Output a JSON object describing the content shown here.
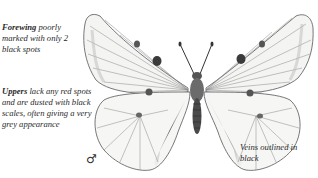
{
  "illustration": {
    "subject": "butterfly",
    "view": "upperside, male"
  },
  "annotations": {
    "forewing": {
      "bold": "Forewing",
      "text": " poorly marked with only 2 black spots"
    },
    "uppers": {
      "bold": "Uppers",
      "text": " lack any red spots and are dusted with black scales, often giving a very grey appearance"
    },
    "veins": {
      "text": "Veins outlined in black"
    },
    "sex_symbol": "♂"
  },
  "colors": {
    "background": "#ffffff",
    "ink": "#2a2a2a",
    "wing_fill": "#f4f4f2",
    "shading": "#6b6b6b"
  }
}
